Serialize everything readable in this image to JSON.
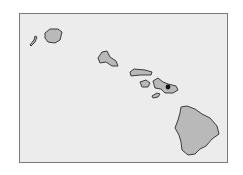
{
  "map": {
    "region": "Hawaiian Islands",
    "frame": {
      "background": "#ececec",
      "border": "#7a7a7a"
    },
    "island_fill": "#b9b9b9",
    "island_stroke": "#3c3c3c",
    "islands": [
      {
        "name": "Niihau",
        "points": "30,45 34,40 35,36 37,37 35,42 31,46"
      },
      {
        "name": "Kauai",
        "points": "45,33 50,29 58,29 62,32 60,40 55,43 48,42 45,38"
      },
      {
        "name": "Oahu",
        "points": "98,58 102,52 107,51 110,57 116,61 118,66 112,66 106,62 100,63"
      },
      {
        "name": "Molokai",
        "points": "130,72 134,69 145,70 152,72 151,75 140,75 131,76"
      },
      {
        "name": "Lanai",
        "points": "140,82 146,80 150,83 148,87 142,87"
      },
      {
        "name": "Kahoolawe",
        "points": "152,96 157,93 160,94 158,97 153,98"
      },
      {
        "name": "Maui",
        "points": "153,81 158,78 163,82 168,84 176,86 178,90 173,93 165,93 161,89 155,88"
      },
      {
        "name": "Hawaii",
        "points": "181,107 187,106 195,109 202,114 210,118 217,126 219,134 212,139 206,146 200,149 195,154 188,155 182,150 181,142 179,135 175,128 178,120 180,113"
      }
    ],
    "markers": [
      {
        "name": "maui-dot",
        "cx": 168,
        "cy": 87,
        "r": 2.4
      }
    ]
  }
}
